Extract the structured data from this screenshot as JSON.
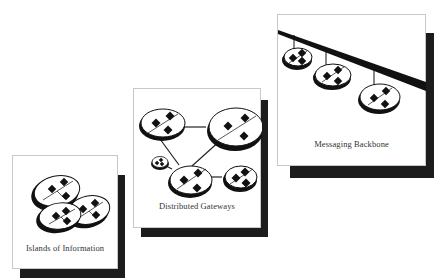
{
  "diagram": {
    "stages": [
      {
        "id": "islands",
        "label": "Islands of Information"
      },
      {
        "id": "gateways",
        "label": "Distributed Gateways"
      },
      {
        "id": "backbone",
        "label": "Messaging Backbone"
      }
    ],
    "colors": {
      "shadow": "#1c1c1c",
      "border": "#c8c8c8",
      "ink": "#111111",
      "text": "#333333",
      "background": "#ffffff"
    }
  }
}
